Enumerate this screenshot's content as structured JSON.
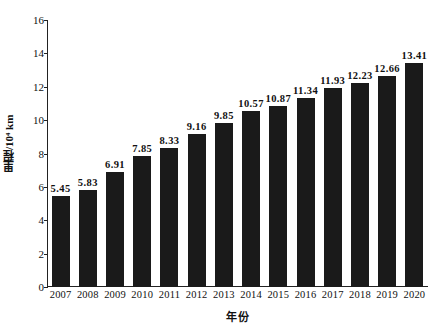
{
  "chart_data": {
    "type": "bar",
    "title": "",
    "subtitle": "",
    "xlabel": "年份",
    "ylabel": "里程/10⁴ km",
    "categories": [
      "2007",
      "2008",
      "2009",
      "2010",
      "2011",
      "2012",
      "2013",
      "2014",
      "2015",
      "2016",
      "2017",
      "2018",
      "2019",
      "2020"
    ],
    "values": [
      5.45,
      5.83,
      6.91,
      7.85,
      8.33,
      9.16,
      9.85,
      10.57,
      10.87,
      11.34,
      11.93,
      12.23,
      12.66,
      13.41
    ],
    "value_labels": [
      "5.45",
      "5.83",
      "6.91",
      "7.85",
      "8.33",
      "9.16",
      "9.85",
      "10.57",
      "10.87",
      "11.34",
      "11.93",
      "12.23",
      "12.66",
      "13.41"
    ],
    "ylim": [
      0,
      16
    ],
    "ytick_values": [
      0,
      2,
      4,
      6,
      8,
      10,
      12,
      14,
      16
    ],
    "ytick_labels": [
      "0",
      "2",
      "4",
      "6",
      "8",
      "10",
      "12",
      "14",
      "16"
    ],
    "grid": false,
    "legend": null,
    "legend_position": "none",
    "bar_color": "#1a1a1a",
    "axis_color": "#222222",
    "background_color": "#ffffff",
    "annotations": []
  }
}
